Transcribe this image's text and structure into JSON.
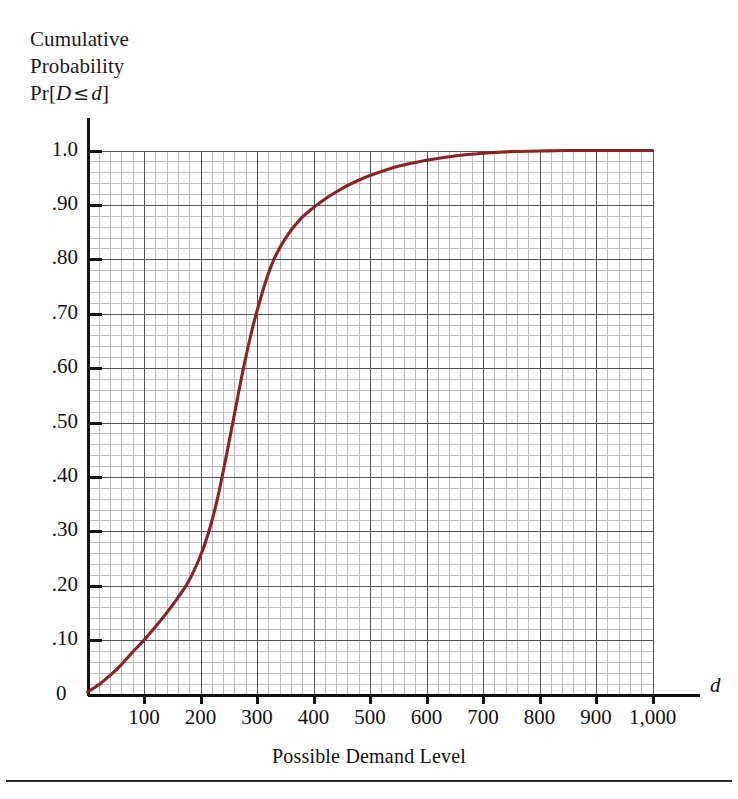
{
  "figure": {
    "background_color": "#ffffff",
    "curve_color": "#8B2420",
    "grid_minor_color": "#bdbdbd",
    "grid_major_color": "#555555",
    "axis_color": "#111111"
  },
  "y_axis": {
    "title_line1": "Cumulative",
    "title_line2": "Probability",
    "title_prefix": "Pr",
    "title_bracket_open": "[",
    "title_var_d_upper": "D",
    "title_le": "≤",
    "title_var_d_lower": "d",
    "title_bracket_close": "]",
    "tick_labels": [
      "1.0",
      ".90",
      ".80",
      ".70",
      ".60",
      ".50",
      ".40",
      ".30",
      ".20",
      ".10",
      "0"
    ],
    "tick_values": [
      1.0,
      0.9,
      0.8,
      0.7,
      0.6,
      0.5,
      0.4,
      0.3,
      0.2,
      0.1,
      0.0
    ],
    "min": 0,
    "max": 1.0
  },
  "x_axis": {
    "caption": "Possible Demand Level",
    "variable_label": "d",
    "tick_labels": [
      "100",
      "200",
      "300",
      "400",
      "500",
      "600",
      "700",
      "800",
      "900",
      "1,000"
    ],
    "tick_values": [
      100,
      200,
      300,
      400,
      500,
      600,
      700,
      800,
      900,
      1000
    ],
    "min": 0,
    "max": 1000
  },
  "chart_data": {
    "type": "line",
    "subtitle": "",
    "xlabel": "Possible Demand Level",
    "ylabel": "Cumulative Probability Pr[D ≤ d]",
    "xlim": [
      0,
      1000
    ],
    "ylim": [
      0,
      1.0
    ],
    "grid": true,
    "grid_minor_step_x": 20,
    "grid_minor_step_y": 0.02,
    "grid_major_step_x": 100,
    "grid_major_step_y": 0.1,
    "legend": null,
    "legend_position": "none",
    "series": [
      {
        "name": "Cumulative distribution of demand",
        "color": "#8B2420",
        "x": [
          0,
          20,
          40,
          60,
          80,
          100,
          120,
          140,
          160,
          180,
          200,
          215,
          230,
          245,
          260,
          275,
          290,
          300,
          315,
          330,
          350,
          375,
          400,
          425,
          450,
          475,
          500,
          550,
          600,
          650,
          700,
          750,
          800,
          850,
          900,
          950,
          1000
        ],
        "y": [
          0.005,
          0.018,
          0.035,
          0.055,
          0.078,
          0.1,
          0.124,
          0.15,
          0.178,
          0.21,
          0.255,
          0.3,
          0.36,
          0.435,
          0.515,
          0.595,
          0.665,
          0.705,
          0.758,
          0.8,
          0.838,
          0.872,
          0.895,
          0.914,
          0.93,
          0.943,
          0.954,
          0.971,
          0.982,
          0.99,
          0.995,
          0.998,
          0.999,
          1.0,
          1.0,
          1.0,
          1.0
        ]
      }
    ],
    "annotations": []
  }
}
